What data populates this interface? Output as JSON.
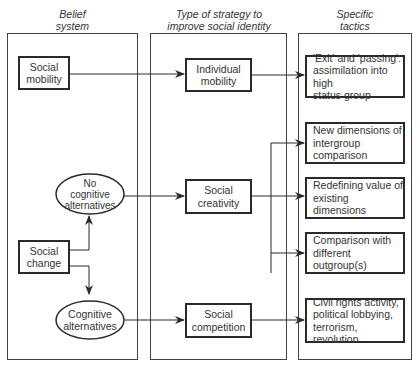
{
  "columns": [
    {
      "header": "Belief\nsystem"
    },
    {
      "header": "Type of strategy to\nimprove social identity"
    },
    {
      "header": "Specific\ntactics"
    }
  ],
  "belief_system": {
    "social_mobility": "Social\nmobility",
    "no_cognitive_alternatives": "No\ncognitive\nalternatives",
    "social_change": "Social\nchange",
    "cognitive_alternatives": "Cognitive\nalternatives"
  },
  "strategies": {
    "individual_mobility": "Individual\nmobility",
    "social_creativity": "Social\ncreativity",
    "social_competition": "Social\ncompetition"
  },
  "tactics": {
    "exit_passing": "'Exit' and 'passing':\nassimilation into high\nstatus group",
    "new_dimensions": "New dimensions of\nintergroup comparison",
    "redefining_value": "Redefining value of\nexisting dimensions",
    "different_outgroups": "Comparison with\ndifferent outgroup(s)",
    "civil_rights": "Civil rights activity,\npolitical lobbying,\nterrorism, revolution"
  }
}
